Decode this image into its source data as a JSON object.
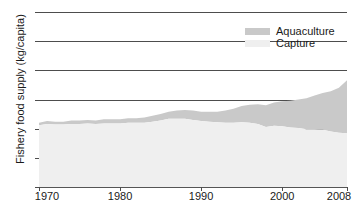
{
  "axes": {
    "ylabel": "Fishery food supply (kg/capita)",
    "yticks": [
      "0",
      "5",
      "10",
      "15",
      "20",
      "25",
      "30"
    ],
    "xticks": [
      "1970",
      "1980",
      "1990",
      "2000",
      "2008"
    ]
  },
  "legend": {
    "items": [
      {
        "label": "Aquaculture",
        "color": "#c9c9c9"
      },
      {
        "label": "Capture",
        "color": "#efefef"
      }
    ]
  },
  "chart_data": {
    "type": "area",
    "stacked": true,
    "title": "",
    "xlabel": "",
    "ylabel": "Fishery food supply (kg/capita)",
    "xlim": [
      1970,
      2008
    ],
    "ylim": [
      0,
      30
    ],
    "yticks": [
      0,
      5,
      10,
      15,
      20,
      25,
      30
    ],
    "xticks": [
      1970,
      1980,
      1990,
      2000,
      2008
    ],
    "grid": "horizontal",
    "legend_position": "top-right",
    "x": [
      1970,
      1971,
      1972,
      1973,
      1974,
      1975,
      1976,
      1977,
      1978,
      1979,
      1980,
      1981,
      1982,
      1983,
      1984,
      1985,
      1986,
      1987,
      1988,
      1989,
      1990,
      1991,
      1992,
      1993,
      1994,
      1995,
      1996,
      1997,
      1998,
      1999,
      2000,
      2001,
      2002,
      2003,
      2004,
      2005,
      2006,
      2007,
      2008
    ],
    "series": [
      {
        "name": "Capture",
        "color": "#efefef",
        "values": [
          10.6,
          10.8,
          10.7,
          10.7,
          10.8,
          10.8,
          10.9,
          10.8,
          10.9,
          10.9,
          10.9,
          11.0,
          11.0,
          11.0,
          11.2,
          11.4,
          11.7,
          11.7,
          11.7,
          11.5,
          11.3,
          11.2,
          11.1,
          11.0,
          11.0,
          11.1,
          11.0,
          10.8,
          10.3,
          10.5,
          10.4,
          10.2,
          10.1,
          9.9,
          9.9,
          9.8,
          9.5,
          9.3,
          9.2
        ]
      },
      {
        "name": "Aquaculture",
        "color": "#c9c9c9",
        "values": [
          0.4,
          0.5,
          0.5,
          0.5,
          0.6,
          0.6,
          0.6,
          0.6,
          0.7,
          0.7,
          0.7,
          0.8,
          0.8,
          0.9,
          1.0,
          1.1,
          1.2,
          1.4,
          1.5,
          1.6,
          1.6,
          1.7,
          1.8,
          2.1,
          2.4,
          2.8,
          3.1,
          3.4,
          3.7,
          4.0,
          4.3,
          4.6,
          4.9,
          5.3,
          5.8,
          6.3,
          6.9,
          7.7,
          9.1
        ]
      }
    ],
    "totals": [
      11.0,
      11.3,
      11.2,
      11.2,
      11.4,
      11.4,
      11.5,
      11.4,
      11.6,
      11.6,
      11.6,
      11.8,
      11.8,
      11.9,
      12.2,
      12.5,
      12.9,
      13.1,
      13.2,
      13.1,
      12.9,
      12.9,
      12.9,
      13.1,
      13.4,
      13.9,
      14.1,
      14.2,
      14.0,
      14.5,
      14.7,
      14.8,
      15.0,
      15.2,
      15.7,
      16.1,
      16.4,
      17.0,
      18.3
    ]
  }
}
